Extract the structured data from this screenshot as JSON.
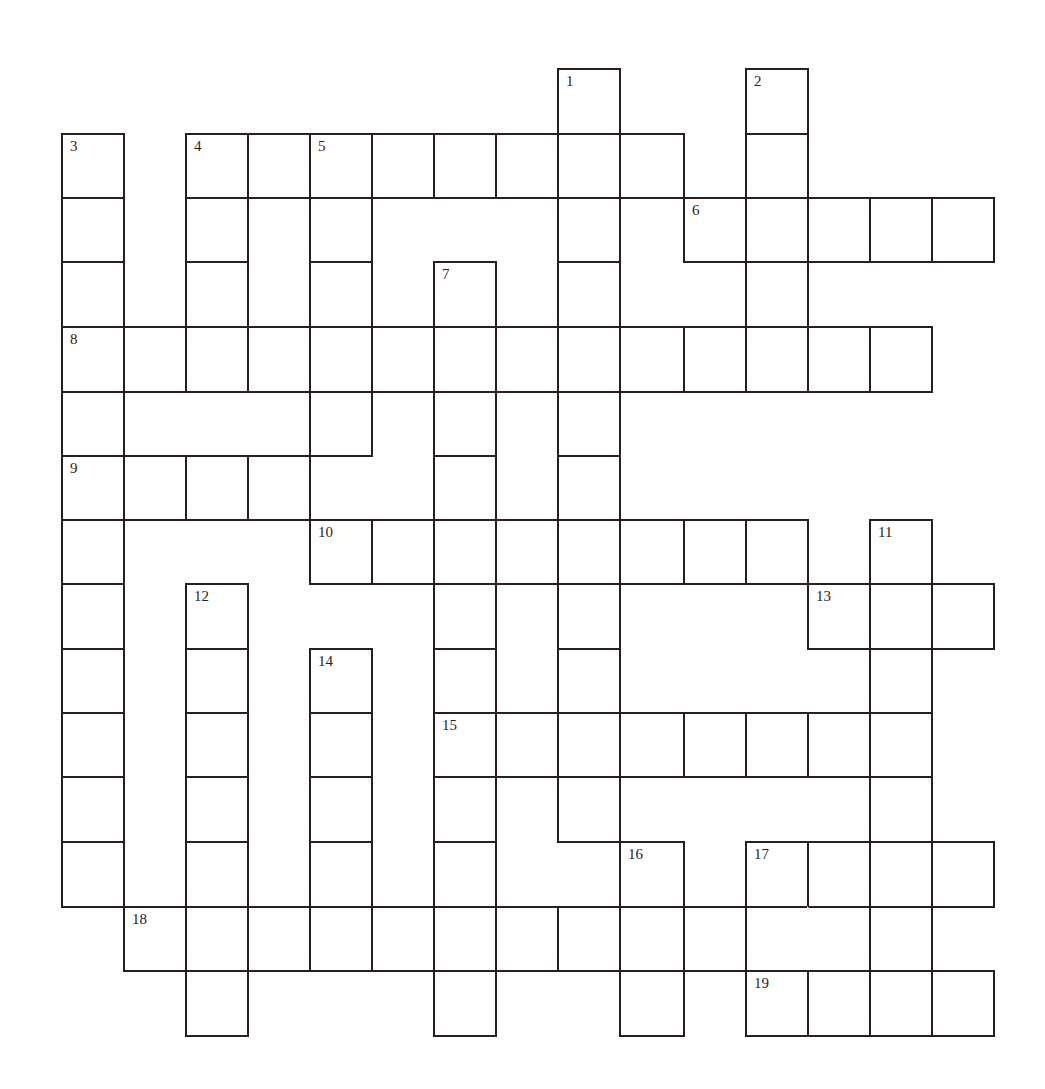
{
  "puzzle": {
    "type": "crossword",
    "ink_color": "#2a1e1e",
    "col_x": [
      62,
      124,
      186,
      248,
      310,
      372,
      434,
      496,
      558,
      620,
      684,
      746,
      808,
      870,
      932,
      994
    ],
    "row_y": [
      69,
      134,
      198,
      262,
      327,
      392,
      456,
      520,
      584,
      649,
      713,
      777,
      842,
      907,
      971,
      1036
    ],
    "cells": [
      {
        "r": 0,
        "c": 8,
        "n": "1"
      },
      {
        "r": 0,
        "c": 11,
        "n": "2"
      },
      {
        "r": 1,
        "c": 0,
        "n": "3"
      },
      {
        "r": 1,
        "c": 2,
        "n": "4"
      },
      {
        "r": 1,
        "c": 3
      },
      {
        "r": 1,
        "c": 4,
        "n": "5"
      },
      {
        "r": 1,
        "c": 5
      },
      {
        "r": 1,
        "c": 6
      },
      {
        "r": 1,
        "c": 7
      },
      {
        "r": 1,
        "c": 8
      },
      {
        "r": 1,
        "c": 9
      },
      {
        "r": 1,
        "c": 11
      },
      {
        "r": 2,
        "c": 0
      },
      {
        "r": 2,
        "c": 2
      },
      {
        "r": 2,
        "c": 4
      },
      {
        "r": 2,
        "c": 8
      },
      {
        "r": 2,
        "c": 10,
        "n": "6"
      },
      {
        "r": 2,
        "c": 11
      },
      {
        "r": 2,
        "c": 12
      },
      {
        "r": 2,
        "c": 13
      },
      {
        "r": 2,
        "c": 14
      },
      {
        "r": 3,
        "c": 0
      },
      {
        "r": 3,
        "c": 2
      },
      {
        "r": 3,
        "c": 4
      },
      {
        "r": 3,
        "c": 6,
        "n": "7"
      },
      {
        "r": 3,
        "c": 8
      },
      {
        "r": 3,
        "c": 11
      },
      {
        "r": 4,
        "c": 0,
        "n": "8"
      },
      {
        "r": 4,
        "c": 1
      },
      {
        "r": 4,
        "c": 2
      },
      {
        "r": 4,
        "c": 3
      },
      {
        "r": 4,
        "c": 4
      },
      {
        "r": 4,
        "c": 5
      },
      {
        "r": 4,
        "c": 6
      },
      {
        "r": 4,
        "c": 7
      },
      {
        "r": 4,
        "c": 8
      },
      {
        "r": 4,
        "c": 9
      },
      {
        "r": 4,
        "c": 10
      },
      {
        "r": 4,
        "c": 11
      },
      {
        "r": 4,
        "c": 12
      },
      {
        "r": 4,
        "c": 13
      },
      {
        "r": 5,
        "c": 0
      },
      {
        "r": 5,
        "c": 4
      },
      {
        "r": 5,
        "c": 6
      },
      {
        "r": 5,
        "c": 8
      },
      {
        "r": 6,
        "c": 0,
        "n": "9"
      },
      {
        "r": 6,
        "c": 1
      },
      {
        "r": 6,
        "c": 2
      },
      {
        "r": 6,
        "c": 3
      },
      {
        "r": 6,
        "c": 6
      },
      {
        "r": 6,
        "c": 8
      },
      {
        "r": 7,
        "c": 0
      },
      {
        "r": 7,
        "c": 4,
        "n": "10"
      },
      {
        "r": 7,
        "c": 5
      },
      {
        "r": 7,
        "c": 6
      },
      {
        "r": 7,
        "c": 7
      },
      {
        "r": 7,
        "c": 8
      },
      {
        "r": 7,
        "c": 9
      },
      {
        "r": 7,
        "c": 10
      },
      {
        "r": 7,
        "c": 11
      },
      {
        "r": 7,
        "c": 13,
        "n": "11"
      },
      {
        "r": 8,
        "c": 0
      },
      {
        "r": 8,
        "c": 2,
        "n": "12"
      },
      {
        "r": 8,
        "c": 6
      },
      {
        "r": 8,
        "c": 8
      },
      {
        "r": 8,
        "c": 12,
        "n": "13"
      },
      {
        "r": 8,
        "c": 13
      },
      {
        "r": 8,
        "c": 14
      },
      {
        "r": 9,
        "c": 0
      },
      {
        "r": 9,
        "c": 2
      },
      {
        "r": 9,
        "c": 4,
        "n": "14"
      },
      {
        "r": 9,
        "c": 6
      },
      {
        "r": 9,
        "c": 8
      },
      {
        "r": 9,
        "c": 13
      },
      {
        "r": 10,
        "c": 0
      },
      {
        "r": 10,
        "c": 2
      },
      {
        "r": 10,
        "c": 4
      },
      {
        "r": 10,
        "c": 6,
        "n": "15"
      },
      {
        "r": 10,
        "c": 7
      },
      {
        "r": 10,
        "c": 8
      },
      {
        "r": 10,
        "c": 9
      },
      {
        "r": 10,
        "c": 10
      },
      {
        "r": 10,
        "c": 11
      },
      {
        "r": 10,
        "c": 12
      },
      {
        "r": 10,
        "c": 13
      },
      {
        "r": 11,
        "c": 0
      },
      {
        "r": 11,
        "c": 2
      },
      {
        "r": 11,
        "c": 4
      },
      {
        "r": 11,
        "c": 6
      },
      {
        "r": 11,
        "c": 8
      },
      {
        "r": 11,
        "c": 13
      },
      {
        "r": 12,
        "c": 0
      },
      {
        "r": 12,
        "c": 2
      },
      {
        "r": 12,
        "c": 4
      },
      {
        "r": 12,
        "c": 6
      },
      {
        "r": 12,
        "c": 9,
        "n": "16"
      },
      {
        "r": 12,
        "c": 11,
        "n": "17"
      },
      {
        "r": 12,
        "c": 12
      },
      {
        "r": 12,
        "c": 13
      },
      {
        "r": 12,
        "c": 14
      },
      {
        "r": 13,
        "c": 1,
        "n": "18"
      },
      {
        "r": 13,
        "c": 2
      },
      {
        "r": 13,
        "c": 3
      },
      {
        "r": 13,
        "c": 4
      },
      {
        "r": 13,
        "c": 5
      },
      {
        "r": 13,
        "c": 6
      },
      {
        "r": 13,
        "c": 7
      },
      {
        "r": 13,
        "c": 8
      },
      {
        "r": 13,
        "c": 9
      },
      {
        "r": 13,
        "c": 10
      },
      {
        "r": 13,
        "c": 11
      },
      {
        "r": 13,
        "c": 12,
        "noleft": true
      },
      {
        "r": 13,
        "c": 13
      },
      {
        "r": 14,
        "c": 2
      },
      {
        "r": 14,
        "c": 6
      },
      {
        "r": 14,
        "c": 9
      },
      {
        "r": 14,
        "c": 11,
        "n": "19"
      },
      {
        "r": 14,
        "c": 12
      },
      {
        "r": 14,
        "c": 13
      },
      {
        "r": 14,
        "c": 14
      }
    ],
    "clue_numbers": [
      "1",
      "2",
      "3",
      "4",
      "5",
      "6",
      "7",
      "8",
      "9",
      "10",
      "11",
      "12",
      "13",
      "14",
      "15",
      "16",
      "17",
      "18",
      "19"
    ]
  }
}
